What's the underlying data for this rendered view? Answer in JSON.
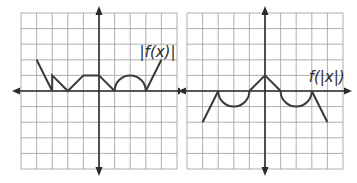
{
  "colors": {
    "grid": "#9a9a9a",
    "axis": "#2b2b2b",
    "curve": "#3a3a3a",
    "background": "#ffffff"
  },
  "graphs": [
    {
      "id": "abs-f-of-x",
      "label": "|f(x)|",
      "label_pos": [
        2.6,
        2.2
      ],
      "grid": {
        "cols": 10,
        "rows": 10,
        "origin_col": 5,
        "origin_row": 5
      },
      "segments": [
        {
          "type": "line",
          "points": [
            [
              -4,
              2
            ],
            [
              -3,
              0
            ],
            [
              -3,
              1
            ],
            [
              -2,
              0
            ],
            [
              -1,
              1
            ],
            [
              0,
              1
            ],
            [
              1,
              0
            ]
          ]
        },
        {
          "type": "arc",
          "center": [
            2,
            0
          ],
          "radius": 1,
          "direction": "up"
        },
        {
          "type": "line",
          "points": [
            [
              3,
              0
            ],
            [
              4,
              2
            ]
          ]
        }
      ]
    },
    {
      "id": "f-of-abs-x",
      "label": "f(|x|)",
      "label_pos": [
        2.8,
        0.55
      ],
      "grid": {
        "cols": 10,
        "rows": 10,
        "origin_col": 5,
        "origin_row": 5
      },
      "segments": [
        {
          "type": "line",
          "points": [
            [
              -4,
              -2
            ],
            [
              -3,
              0
            ]
          ]
        },
        {
          "type": "arc",
          "center": [
            -2,
            0
          ],
          "radius": 1,
          "direction": "down"
        },
        {
          "type": "line",
          "points": [
            [
              -1,
              0
            ],
            [
              0,
              1
            ],
            [
              1,
              0
            ]
          ]
        },
        {
          "type": "arc",
          "center": [
            2,
            0
          ],
          "radius": 1,
          "direction": "down"
        },
        {
          "type": "line",
          "points": [
            [
              3,
              0
            ],
            [
              4,
              -2
            ]
          ]
        }
      ]
    }
  ]
}
